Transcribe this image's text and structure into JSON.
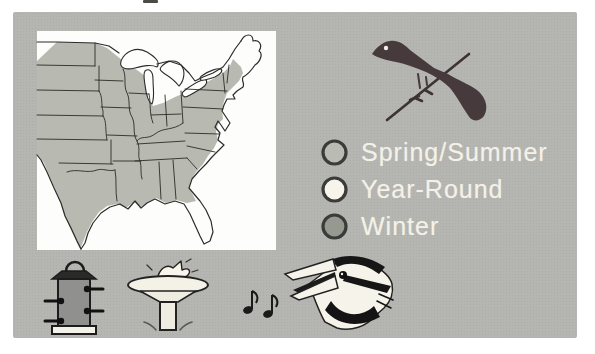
{
  "page": {
    "background": "#ffffff"
  },
  "card": {
    "background": "#b5b6b2"
  },
  "map": {
    "name": "eastern-us-range-map",
    "panel_background": "#fdfdfb",
    "range_fill": "#b8bab1",
    "outline_color": "#2b2b29"
  },
  "bird_silhouette": {
    "name": "perched-blackbird-silhouette",
    "color": "#463a3c",
    "branch_color": "#3d3335"
  },
  "legend": {
    "text_color": "#f4f1e6",
    "ring_color": "#3b3b39",
    "items": [
      {
        "label": "Spring/Summer",
        "swatch_color": "#babcb4"
      },
      {
        "label": "Year-Round",
        "swatch_color": "#f7f5eb"
      },
      {
        "label": "Winter",
        "swatch_color": "#959990"
      }
    ]
  },
  "icons": {
    "feeder": {
      "name": "tube-feeder-icon"
    },
    "bath": {
      "name": "bird-bath-icon"
    },
    "notes": {
      "name": "music-notes-icon"
    },
    "song": {
      "name": "singing-bird-head-icon"
    }
  }
}
